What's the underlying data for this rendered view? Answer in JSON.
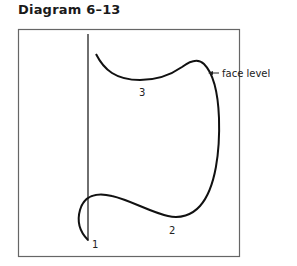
{
  "title": "Diagram 6–13",
  "labels": {
    "point1": "1",
    "point2": "2",
    "point3": "3",
    "annotation": "face level"
  },
  "colors": {
    "line": "#111111",
    "frame": "#666666"
  }
}
